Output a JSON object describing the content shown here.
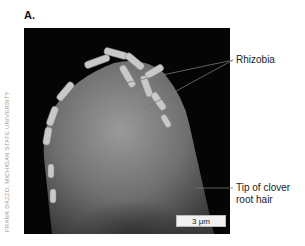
{
  "figure": {
    "panel_label": "A.",
    "image_description": "Scanning electron micrograph of rod-shaped bacteria on the tip of a clover root hair",
    "credit": "FRANK DAZZO, MICHIGAN STATE UNIVERSITY",
    "scale_bar": "3 μm",
    "callouts": [
      {
        "id": "rhizobia",
        "label": "Rhizobia"
      },
      {
        "id": "root-hair-tip",
        "label_line1": "Tip of clover",
        "label_line2": "root hair"
      }
    ]
  }
}
